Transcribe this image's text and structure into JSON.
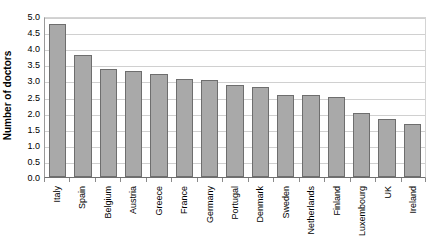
{
  "chart_data": {
    "type": "bar",
    "title": "",
    "xlabel": "",
    "ylabel": "Number of doctors",
    "ylim": [
      0.0,
      5.0
    ],
    "ytick_labels": [
      "5.0",
      "4.5",
      "4.0",
      "3.5",
      "3.0",
      "2.5",
      "2.0",
      "1.5",
      "1.0",
      "0.5",
      "0.0"
    ],
    "ytick_values": [
      5.0,
      4.5,
      4.0,
      3.5,
      3.0,
      2.5,
      2.0,
      1.5,
      1.0,
      0.5,
      0.0
    ],
    "grid": true,
    "legend": "none",
    "bar_color": "#a9a9a9",
    "bar_border_color": "#6e6e6e",
    "gridline_color": "#d0d0d0",
    "categories": [
      "Italy",
      "Spain",
      "Belgium",
      "Austria",
      "Greece",
      "France",
      "Germany",
      "Portugal",
      "Denmark",
      "Sweden",
      "Netherlands",
      "Finland",
      "Luxembourg",
      "UK",
      "Ireland"
    ],
    "values": [
      4.75,
      3.8,
      3.35,
      3.3,
      3.2,
      3.05,
      3.0,
      2.85,
      2.8,
      2.55,
      2.55,
      2.5,
      2.0,
      1.8,
      1.65
    ]
  }
}
